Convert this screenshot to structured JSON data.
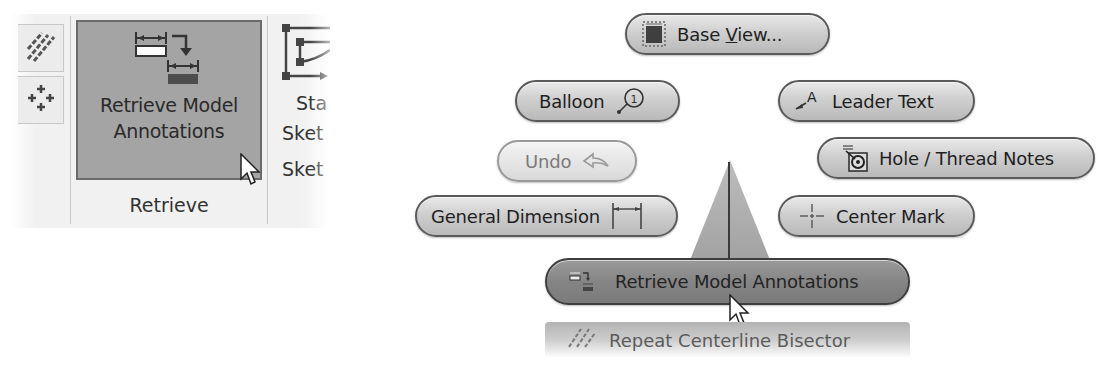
{
  "ribbon": {
    "small_buttons": [
      {
        "icon": "hatch-lines-icon"
      },
      {
        "icon": "center-pattern-icon"
      }
    ],
    "big_button": {
      "label_line1": "Retrieve Model",
      "label_line2": "Annotations",
      "icon": "retrieve-annotations-icon",
      "state": "hover"
    },
    "group_label": "Retrieve",
    "partial_column": {
      "icon": "start-sketch-icon",
      "label1": "Sta",
      "label2": "Sket",
      "group_label": "Sket"
    }
  },
  "marking_menu": {
    "items": [
      {
        "id": "base-view",
        "label_prefix": "Base ",
        "label_underlined": "V",
        "label_suffix": "iew...",
        "icon": "base-view-icon",
        "position": "north"
      },
      {
        "id": "balloon",
        "label": "Balloon",
        "icon": "balloon-icon",
        "position": "north-west"
      },
      {
        "id": "leader-text",
        "label": "Leader Text",
        "icon": "leader-text-icon",
        "position": "north-east"
      },
      {
        "id": "undo",
        "label": "Undo",
        "icon": "undo-arrow-icon",
        "position": "west-upper",
        "state": "disabled"
      },
      {
        "id": "hole-thread-notes",
        "label": "Hole / Thread Notes",
        "icon": "hole-thread-icon",
        "position": "east-upper"
      },
      {
        "id": "general-dimension",
        "label": "General Dimension",
        "icon": "dimension-icon",
        "position": "west"
      },
      {
        "id": "center-mark",
        "label": "Center Mark",
        "icon": "center-mark-icon",
        "position": "east"
      },
      {
        "id": "retrieve-model-annotations",
        "label": "Retrieve Model Annotations",
        "icon": "retrieve-annotations-icon",
        "position": "south",
        "state": "highlighted"
      }
    ],
    "overflow_item": {
      "label": "Repeat Centerline Bisector",
      "icon": "centerline-bisector-icon"
    }
  }
}
